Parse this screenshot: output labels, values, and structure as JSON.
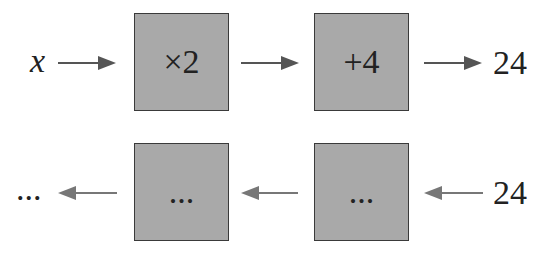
{
  "forward_row": {
    "input_label": "x",
    "boxes": [
      {
        "label": "×2"
      },
      {
        "label": "+4"
      }
    ],
    "output_label": "24"
  },
  "reverse_row": {
    "input_label": "24",
    "boxes": [
      {
        "label": "..."
      },
      {
        "label": "..."
      }
    ],
    "output_label": "..."
  },
  "colors": {
    "box_fill": "#a9a9a9",
    "box_border": "#3a3a3a",
    "forward_arrow": "#555555",
    "reverse_arrow": "#777777"
  }
}
